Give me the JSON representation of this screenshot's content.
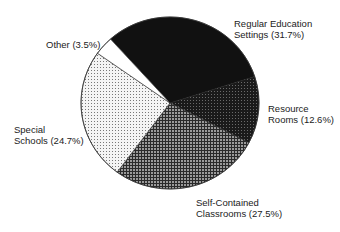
{
  "chart_data": {
    "type": "pie",
    "title": "",
    "start_angle_deg": -132,
    "direction": "clockwise",
    "slices": [
      {
        "label": "Regular Education Settings",
        "value": 31.7,
        "display": "Regular Education Settings (31.7%)",
        "fill": "#111111",
        "pattern": "solid"
      },
      {
        "label": "Resource Rooms",
        "value": 12.6,
        "display": "Resource Rooms (12.6%)",
        "fill": "#222222",
        "pattern": "dark-mesh"
      },
      {
        "label": "Self-Contained Classrooms",
        "value": 27.5,
        "display": "Self-Contained Classrooms (27.5%)",
        "fill": "#555555",
        "pattern": "grid"
      },
      {
        "label": "Special Schools",
        "value": 24.7,
        "display": "Special Schools (24.7%)",
        "fill": "#dddddd",
        "pattern": "light-dots"
      },
      {
        "label": "Other",
        "value": 3.5,
        "display": "Other (3.5%)",
        "fill": "#ffffff",
        "pattern": "solid"
      }
    ]
  },
  "labels": {
    "regular": {
      "line1": "Regular Education",
      "line2": "Settings (31.7%)"
    },
    "resource": {
      "line1": "Resource",
      "line2": "Rooms (12.6%)"
    },
    "selfcontained": {
      "line1": "Self-Contained",
      "line2": "Classrooms (27.5%)"
    },
    "special": {
      "line1": "Special",
      "line2": "Schools (24.7%)"
    },
    "other": {
      "line1": "Other (3.5%)"
    }
  }
}
